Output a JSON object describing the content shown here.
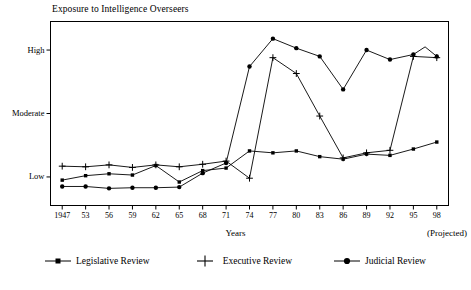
{
  "chart_data": {
    "type": "line",
    "title": "Exposure to Intelligence Overseers",
    "xlabel": "Years",
    "ylabel": "",
    "x_note": "(Projected)",
    "categories": [
      "1947",
      "53",
      "56",
      "59",
      "62",
      "65",
      "68",
      "71",
      "74",
      "77",
      "80",
      "83",
      "86",
      "89",
      "92",
      "95",
      "98"
    ],
    "ytick_labels": [
      "Low",
      "Moderate",
      "High"
    ],
    "ytick_values": [
      1,
      2,
      3
    ],
    "ylim": [
      0.55,
      3.45
    ],
    "grid": false,
    "legend_position": "bottom",
    "series": [
      {
        "name": "Legislative Review",
        "marker": "square",
        "values": [
          0.95,
          1.02,
          1.05,
          1.03,
          1.18,
          0.92,
          1.1,
          1.14,
          1.41,
          1.38,
          1.41,
          1.32,
          1.28,
          1.36,
          1.34,
          1.44,
          1.55
        ]
      },
      {
        "name": "Executive Review",
        "marker": "plus",
        "values": [
          1.17,
          1.16,
          1.19,
          1.15,
          1.19,
          1.16,
          1.2,
          1.25,
          0.98,
          2.88,
          2.63,
          1.96,
          1.3,
          1.38,
          1.42,
          2.9,
          2.88
        ]
      },
      {
        "name": "Judicial Review",
        "marker": "circle",
        "values": [
          0.85,
          0.85,
          0.82,
          0.83,
          0.83,
          0.84,
          1.06,
          1.22,
          2.74,
          3.18,
          3.03,
          2.9,
          2.38,
          3.0,
          2.85,
          2.93,
          2.9
        ]
      }
    ],
    "annotations": [
      {
        "series": "Judicial Review",
        "between": [
          "95",
          "98"
        ],
        "value": 3.05,
        "note": "minor peak between 95 and 98"
      }
    ]
  },
  "legend": {
    "items": [
      {
        "label": "Legislative Review",
        "key": "legend-key-legislative"
      },
      {
        "label": "Executive Review",
        "key": "legend-key-executive"
      },
      {
        "label": "Judicial Review",
        "key": "legend-key-judicial"
      }
    ]
  },
  "colors": {
    "line": "#000000",
    "frame": "#000000",
    "background": "#ffffff"
  }
}
